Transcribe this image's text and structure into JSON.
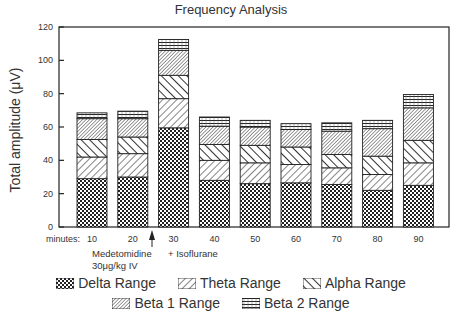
{
  "chart_data": {
    "type": "bar",
    "stacked": true,
    "title": "Frequency Analysis",
    "xlabel": "minutes:",
    "ylabel": "Total amplitude (μV)",
    "ylim": [
      0,
      120
    ],
    "yticks": [
      0,
      20,
      40,
      60,
      80,
      100,
      120
    ],
    "categories": [
      "10",
      "20",
      "30",
      "40",
      "50",
      "60",
      "70",
      "80",
      "90"
    ],
    "series": [
      {
        "name": "Delta Range",
        "pattern": "checker",
        "values": [
          29,
          30,
          59.5,
          28,
          26,
          26.5,
          25.5,
          22,
          25
        ]
      },
      {
        "name": "Theta Range",
        "pattern": "diag-right",
        "values": [
          13,
          14,
          17.5,
          12,
          12.5,
          11,
          10,
          9.5,
          13.5
        ]
      },
      {
        "name": "Alpha Range",
        "pattern": "diag-left",
        "values": [
          10.5,
          10,
          14,
          9.5,
          10.5,
          10.5,
          8,
          11,
          13.5
        ]
      },
      {
        "name": "Beta 1 Range",
        "pattern": "fine-diag",
        "values": [
          12.5,
          11,
          15,
          11,
          11,
          10.5,
          14,
          16.5,
          19.5
        ]
      },
      {
        "name": "Beta 2 Range",
        "pattern": "horizontal",
        "values": [
          3.5,
          4.5,
          6.5,
          5.5,
          4,
          3.5,
          5,
          5,
          8
        ]
      }
    ],
    "totals": [
      68.5,
      69.5,
      112.5,
      66,
      64,
      62,
      62.5,
      64,
      79.5
    ],
    "annotations": [
      {
        "text": "Medetomidine",
        "at": "between 10 and 20"
      },
      {
        "text": "30μg/kg IV",
        "at": "between 10 and 20"
      },
      {
        "text": "+ Isoflurane",
        "at": "30"
      },
      {
        "text": "arrow-up",
        "at": "between 20 and 30"
      }
    ],
    "grid": false,
    "legend_position": "bottom"
  },
  "labels": {
    "title": "Frequency Analysis",
    "ylabel": "Total amplitude (μV)",
    "x_prefix": "minutes:",
    "note_drug": "Medetomidine",
    "note_dose": "30μg/kg IV",
    "note_iso": "+ Isoflurane"
  },
  "legend": {
    "row1": [
      "Delta Range",
      "Theta Range",
      "Alpha Range"
    ],
    "row2": [
      "Beta 1 Range",
      "Beta 2 Range"
    ]
  },
  "colors": {
    "ink": "#222222",
    "background": "#ffffff"
  }
}
